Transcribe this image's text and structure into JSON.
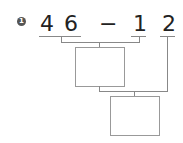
{
  "problem": {
    "index": "1",
    "digits": [
      "4",
      "6",
      "1",
      "2"
    ],
    "operator": "−",
    "answer_boxes": [
      "",
      ""
    ]
  }
}
